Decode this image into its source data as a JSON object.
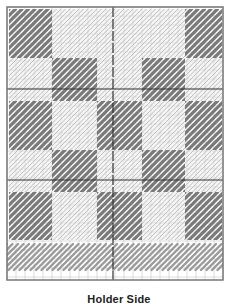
{
  "diagram": {
    "type": "plastic-canvas-stitch-chart",
    "caption": "Holder Side",
    "canvas": {
      "left": 7,
      "top": 7,
      "right": 223,
      "bottom": 280,
      "cell": 9,
      "heavy_vertical": [
        113
      ],
      "heavy_horizontal": [
        89,
        180
      ]
    },
    "colors": {
      "background": "#ffffff",
      "grid_fine": "#c8c8c8",
      "grid_heavy": "#333333",
      "frame": "#777777",
      "dark_stitch": "#7a7a7a",
      "light_stitch_outline": "#a8a8a8",
      "light_block_fill": "#ececec",
      "band_stitch": "#9a9a9a"
    },
    "blocks": {
      "rows": [
        {
          "y0": 9,
          "y1": 58,
          "pattern": [
            "dark",
            "light",
            "light",
            "light",
            "dark"
          ]
        },
        {
          "y0": 58,
          "y1": 101,
          "pattern": [
            "light",
            "dark",
            "light",
            "dark",
            "light"
          ]
        },
        {
          "y0": 101,
          "y1": 150,
          "pattern": [
            "dark",
            "light",
            "dark",
            "light",
            "dark"
          ]
        },
        {
          "y0": 150,
          "y1": 192,
          "pattern": [
            "light",
            "dark",
            "light",
            "dark",
            "light"
          ]
        },
        {
          "y0": 192,
          "y1": 240,
          "pattern": [
            "dark",
            "light",
            "dark",
            "light",
            "dark"
          ]
        }
      ],
      "cols": [
        {
          "x0": 9,
          "x1": 52
        },
        {
          "x0": 52,
          "x1": 97
        },
        {
          "x0": 97,
          "x1": 142
        },
        {
          "x0": 142,
          "x1": 185
        },
        {
          "x0": 185,
          "x1": 222
        }
      ]
    },
    "band": {
      "y0": 244,
      "y1": 270
    }
  }
}
